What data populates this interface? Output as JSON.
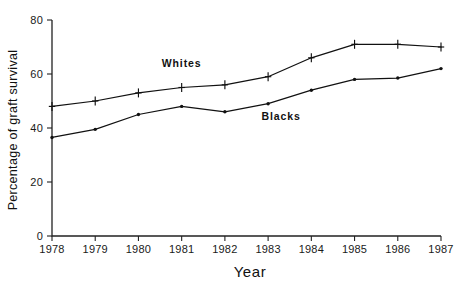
{
  "chart_data": {
    "type": "line",
    "title": "",
    "xlabel": "Year",
    "ylabel": "Percentage of graft survival",
    "categories": [
      "1978",
      "1979",
      "1980",
      "1981",
      "1982",
      "1983",
      "1984",
      "1985",
      "1986",
      "1987"
    ],
    "x": [
      1978,
      1979,
      1980,
      1981,
      1982,
      1983,
      1984,
      1985,
      1986,
      1987
    ],
    "xlim": [
      1978,
      1987
    ],
    "ylim": [
      0,
      80
    ],
    "yticks": [
      0,
      20,
      40,
      60,
      80
    ],
    "ytick_labels": [
      "0",
      "20",
      "40",
      "60",
      "80"
    ],
    "xtick_labels": [
      "1978",
      "1979",
      "1980",
      "1981",
      "1982",
      "1983",
      "1984",
      "1985",
      "1986",
      "1987"
    ],
    "grid": false,
    "legend_position": "inline-annotation",
    "series": [
      {
        "name": "Whites",
        "marker": "plus",
        "color": "#111111",
        "values": [
          48,
          50,
          53,
          55,
          56,
          59,
          66,
          71,
          71,
          70
        ]
      },
      {
        "name": "Blacks",
        "marker": "dot",
        "color": "#111111",
        "values": [
          36.5,
          39.5,
          45,
          48,
          46,
          49,
          54,
          58,
          58.5,
          62
        ]
      }
    ],
    "annotations": [
      {
        "text": "Whites",
        "x": 1981.0,
        "y": 62.5
      },
      {
        "text": "Blacks",
        "x": 1983.3,
        "y": 43.0
      }
    ]
  },
  "axes": {
    "y_axis_title": "Percentage of graft survival",
    "x_axis_title": "Year"
  }
}
